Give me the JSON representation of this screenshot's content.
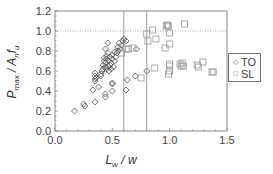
{
  "chart_data": {
    "type": "scatter",
    "title": "",
    "xlabel": "L_w / w",
    "ylabel": "P_max / A_n f_u",
    "xlim": [
      0.0,
      1.5
    ],
    "ylim": [
      0.0,
      1.2
    ],
    "xticks": [
      "0.0",
      "0.5",
      "1.0",
      "1.5"
    ],
    "yticks": [
      "0.0",
      "0.2",
      "0.4",
      "0.6",
      "0.8",
      "1.0",
      "1.2"
    ],
    "grid": false,
    "reference_lines": {
      "vertical": [
        0.6,
        0.8
      ],
      "horizontal": [
        1.0
      ]
    },
    "legend_position": "right-outside",
    "series": [
      {
        "name": "TO",
        "marker": "diamond",
        "points": [
          [
            0.17,
            0.2
          ],
          [
            0.25,
            0.27
          ],
          [
            0.26,
            0.25
          ],
          [
            0.35,
            0.29
          ],
          [
            0.35,
            0.5
          ],
          [
            0.35,
            0.52
          ],
          [
            0.35,
            0.55
          ],
          [
            0.35,
            0.58
          ],
          [
            0.36,
            0.53
          ],
          [
            0.44,
            0.34
          ],
          [
            0.44,
            0.37
          ],
          [
            0.5,
            0.47
          ],
          [
            0.5,
            0.48
          ],
          [
            0.4,
            0.55
          ],
          [
            0.41,
            0.6
          ],
          [
            0.42,
            0.62
          ],
          [
            0.42,
            0.66
          ],
          [
            0.43,
            0.7
          ],
          [
            0.43,
            0.73
          ],
          [
            0.44,
            0.64
          ],
          [
            0.44,
            0.68
          ],
          [
            0.45,
            0.62
          ],
          [
            0.45,
            0.72
          ],
          [
            0.45,
            0.75
          ],
          [
            0.46,
            0.65
          ],
          [
            0.46,
            0.78
          ],
          [
            0.47,
            0.6
          ],
          [
            0.47,
            0.7
          ],
          [
            0.48,
            0.66
          ],
          [
            0.48,
            0.74
          ],
          [
            0.49,
            0.62
          ],
          [
            0.49,
            0.68
          ],
          [
            0.5,
            0.72
          ],
          [
            0.5,
            0.76
          ],
          [
            0.51,
            0.64
          ],
          [
            0.52,
            0.7
          ],
          [
            0.52,
            0.79
          ],
          [
            0.53,
            0.74
          ],
          [
            0.54,
            0.78
          ],
          [
            0.55,
            0.8
          ],
          [
            0.55,
            0.84
          ],
          [
            0.56,
            0.88
          ],
          [
            0.57,
            0.82
          ],
          [
            0.58,
            0.86
          ],
          [
            0.59,
            0.9
          ],
          [
            0.6,
            0.92
          ],
          [
            0.62,
            0.9
          ],
          [
            0.63,
            0.51
          ],
          [
            0.62,
            0.41
          ],
          [
            0.7,
            0.55
          ],
          [
            0.71,
            0.82
          ],
          [
            0.8,
            0.6
          ],
          [
            0.33,
            0.41
          ],
          [
            0.38,
            0.44
          ],
          [
            0.44,
            0.82
          ],
          [
            0.46,
            0.88
          ],
          [
            0.5,
            0.4
          ],
          [
            0.4,
            0.57
          ]
        ]
      },
      {
        "name": "SL",
        "marker": "square",
        "points": [
          [
            0.55,
            0.82
          ],
          [
            0.58,
            0.78
          ],
          [
            0.62,
            0.82
          ],
          [
            0.64,
            0.82
          ],
          [
            0.68,
            0.83
          ],
          [
            0.75,
            0.53
          ],
          [
            0.8,
            0.97
          ],
          [
            0.81,
            0.9
          ],
          [
            0.85,
            1.01
          ],
          [
            0.87,
            0.63
          ],
          [
            0.88,
            0.92
          ],
          [
            0.96,
            0.83
          ],
          [
            0.97,
            1.05
          ],
          [
            0.98,
            1.06
          ],
          [
            0.99,
            1.05
          ],
          [
            0.99,
            0.57
          ],
          [
            1.0,
            0.6
          ],
          [
            1.0,
            0.65
          ],
          [
            1.0,
            0.67
          ],
          [
            1.0,
            0.87
          ],
          [
            1.0,
            0.98
          ],
          [
            1.09,
            0.67
          ],
          [
            1.1,
            0.65
          ],
          [
            1.11,
            0.68
          ],
          [
            1.12,
            0.65
          ],
          [
            1.13,
            1.07
          ],
          [
            1.24,
            0.66
          ],
          [
            1.25,
            0.64
          ],
          [
            1.29,
            0.69
          ],
          [
            1.37,
            0.59
          ],
          [
            1.38,
            0.59
          ]
        ]
      }
    ]
  },
  "axes": {
    "x_title_main": "L",
    "x_title_sub": "w",
    "x_title_rest": " / w",
    "y_title_main": "P",
    "y_title_sub": "max",
    "y_title_mid": " / A",
    "y_title_sub2": "n",
    "y_title_f": "f",
    "y_title_sub3": "u"
  },
  "legend": {
    "items": [
      {
        "symbol": "◇",
        "label": "TO"
      },
      {
        "symbol": "□",
        "label": "SL"
      }
    ]
  }
}
